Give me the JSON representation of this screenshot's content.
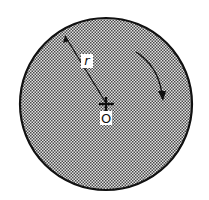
{
  "diagram": {
    "shape": "circle",
    "fill_pattern": "stippled-gray",
    "colors": {
      "outline": "#111111",
      "fill_light": "#e6e6e6",
      "fill_dark": "#555555",
      "label_bg": "#ffffff"
    },
    "radius_label": "r",
    "center_label": "O",
    "rotation_direction": "clockwise"
  }
}
